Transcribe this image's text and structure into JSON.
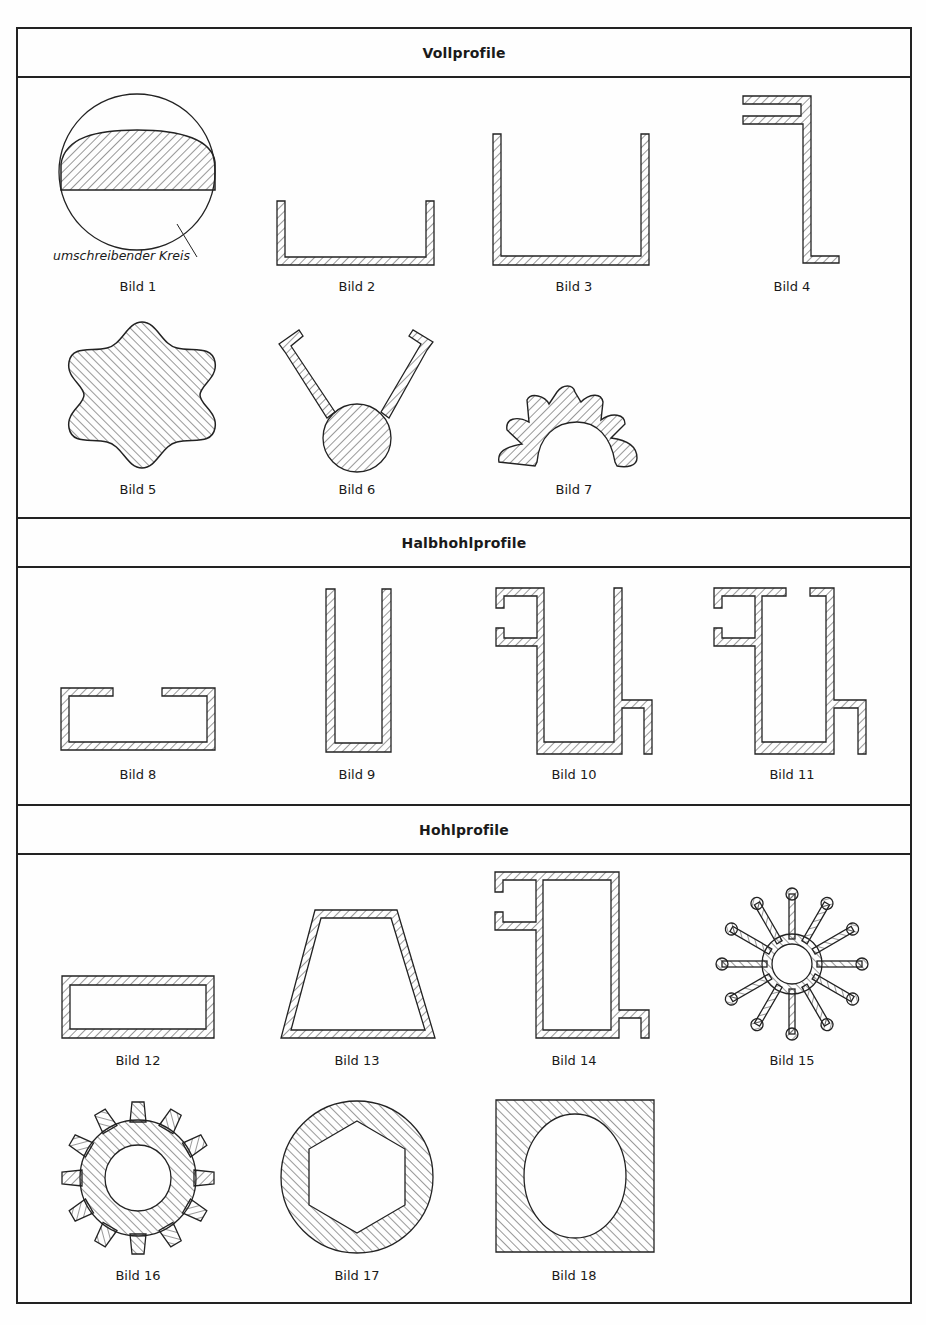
{
  "sections": [
    {
      "title": "Vollprofile"
    },
    {
      "title": "Halbhohlprofile"
    },
    {
      "title": "Hohlprofile"
    }
  ],
  "figures": [
    {
      "label": "Bild 1",
      "annotation": "umschreibender Kreis"
    },
    {
      "label": "Bild 2"
    },
    {
      "label": "Bild 3"
    },
    {
      "label": "Bild 4"
    },
    {
      "label": "Bild 5"
    },
    {
      "label": "Bild 6"
    },
    {
      "label": "Bild 7"
    },
    {
      "label": "Bild 8"
    },
    {
      "label": "Bild 9"
    },
    {
      "label": "Bild 10"
    },
    {
      "label": "Bild 11"
    },
    {
      "label": "Bild 12"
    },
    {
      "label": "Bild 13"
    },
    {
      "label": "Bild 14"
    },
    {
      "label": "Bild 15"
    },
    {
      "label": "Bild 16"
    },
    {
      "label": "Bild 17"
    },
    {
      "label": "Bild 18"
    }
  ],
  "colors": {
    "line": "#222222",
    "paper": "#fefefe"
  }
}
